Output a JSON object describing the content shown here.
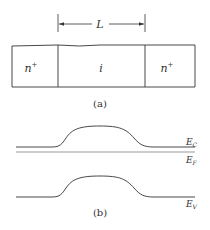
{
  "figure_a": {
    "length_label": "L",
    "regions": [
      {
        "label": "n",
        "sup": "+"
      },
      {
        "label": "i",
        "sup": ""
      },
      {
        "label": "n",
        "sup": "+"
      }
    ],
    "caption": "(a)"
  },
  "figure_b": {
    "bands": [
      {
        "name": "E",
        "sub": "C"
      },
      {
        "name": "E",
        "sub": "F"
      },
      {
        "name": "E",
        "sub": "V"
      }
    ],
    "caption": "(b)"
  }
}
